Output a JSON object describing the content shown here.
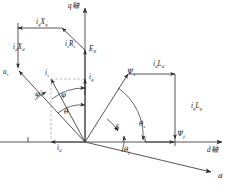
{
  "figure": {
    "kind": "phasor-vector-diagram",
    "background_color": "#ffffff",
    "line_color": "#2b2b2b",
    "dash_color": "#8a8a8a",
    "text_color": "#151515"
  },
  "axes": {
    "q_axis_label": "q轴",
    "d_axis_label": "d轴",
    "alpha_axis_label": "α",
    "origin": {
      "x": 85,
      "y": 142
    }
  },
  "vectors": {
    "u_s": "us",
    "i_s": "is",
    "i_q": "iq",
    "i_d": "id",
    "E_0": "E0",
    "is_Rs": "isRs",
    "iq_Xq": "iqXq",
    "id_Xd": "idXd",
    "psi_s": "Ψs",
    "psi_f": "Ψf",
    "id_Ld": "idLd",
    "iq_Lq": "iqLq"
  },
  "labels": [
    {
      "id": "q-axis",
      "base": "q",
      "sub": "",
      "cjk": "轴",
      "x": 68,
      "y": 4
    },
    {
      "id": "d-axis",
      "base": "d",
      "sub": "",
      "cjk": "轴",
      "x": 208,
      "y": 148
    },
    {
      "id": "alpha",
      "base": "α",
      "sub": "",
      "cjk": "",
      "x": 219,
      "y": 174
    },
    {
      "id": "iq-Xq",
      "base": "i",
      "sub": "q",
      "post": "X",
      "postsub": "q",
      "x": 38,
      "y": 21
    },
    {
      "id": "id-Xd",
      "base": "i",
      "sub": "d",
      "post": "X",
      "postsub": "d",
      "x": 15,
      "y": 45
    },
    {
      "id": "is-Rs",
      "base": "i",
      "sub": "s",
      "post": "R",
      "postsub": "s",
      "x": 66,
      "y": 42
    },
    {
      "id": "E0",
      "base": "E",
      "sub": "0",
      "x": 90,
      "y": 47
    },
    {
      "id": "us",
      "base": "u",
      "sub": "s",
      "x": 4,
      "y": 70
    },
    {
      "id": "is",
      "base": "i",
      "sub": "s",
      "x": 46,
      "y": 71
    },
    {
      "id": "iq",
      "base": "i",
      "sub": "q",
      "x": 90,
      "y": 75
    },
    {
      "id": "id",
      "base": "i",
      "sub": "d",
      "x": 58,
      "y": 145
    },
    {
      "id": "phi-p",
      "base": "φ",
      "sub": "",
      "prime": "′",
      "x": 36,
      "y": 91
    },
    {
      "id": "phi",
      "base": "φ",
      "sub": "",
      "x": 62,
      "y": 93
    },
    {
      "id": "theta",
      "base": "θ",
      "sub": "",
      "x": 65,
      "y": 110
    },
    {
      "id": "delta",
      "base": "δ",
      "sub": "",
      "x": 116,
      "y": 126
    },
    {
      "id": "theta-s",
      "base": "θ",
      "sub": "s",
      "x": 140,
      "y": 122
    },
    {
      "id": "theta-f",
      "base": "θ",
      "sub": "f",
      "x": 125,
      "y": 148
    },
    {
      "id": "psi-s",
      "base": "Ψ",
      "sub": "s",
      "x": 128,
      "y": 70
    },
    {
      "id": "id-Ld",
      "base": "i",
      "sub": "d",
      "post": "L",
      "postsub": "d",
      "x": 155,
      "y": 62
    },
    {
      "id": "iq-Lq",
      "base": "i",
      "sub": "q",
      "post": "L",
      "postsub": "q",
      "x": 192,
      "y": 105
    },
    {
      "id": "psi-f",
      "base": "Ψ",
      "sub": "f",
      "x": 178,
      "y": 131
    }
  ]
}
